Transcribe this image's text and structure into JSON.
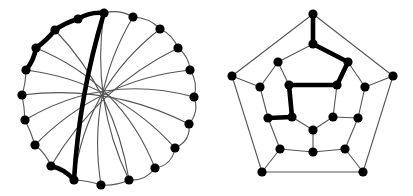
{
  "figure": {
    "background_color": "#ffffff",
    "width": 413,
    "height": 196,
    "vertex_color": "#000000",
    "edge_color": "#555555",
    "highlight_color": "#000000",
    "vertex_radius": 4.6,
    "edge_width": 1.1,
    "highlight_width": 4.6
  },
  "chart_data": {
    "type": "diagram",
    "panels": [
      {
        "name": "circular-layout",
        "label": "Circular Hamiltonian drawing",
        "vertex_count": 20,
        "edge_count": 30,
        "highlighted_cycle_length": 6
      },
      {
        "name": "pentagonal-layout",
        "label": "Pentagonal GP(10,3) drawing",
        "vertex_count": 20,
        "edge_count": 30,
        "highlighted_cycle_length": 6
      }
    ]
  },
  "left_graph": {
    "name": "circular-layout",
    "center": [
      110,
      98
    ],
    "radius_x": 85,
    "radius_y": 88,
    "vertices": [
      {
        "id": "L0",
        "x": 104,
        "y": 13
      },
      {
        "id": "L1",
        "x": 133,
        "y": 17
      },
      {
        "id": "L2",
        "x": 160,
        "y": 29
      },
      {
        "id": "L3",
        "x": 178,
        "y": 48
      },
      {
        "id": "L4",
        "x": 190,
        "y": 70
      },
      {
        "id": "L5",
        "x": 194,
        "y": 97
      },
      {
        "id": "L6",
        "x": 189,
        "y": 124
      },
      {
        "id": "L7",
        "x": 175,
        "y": 148
      },
      {
        "id": "L8",
        "x": 155,
        "y": 168
      },
      {
        "id": "L9",
        "x": 129,
        "y": 180
      },
      {
        "id": "L10",
        "x": 101,
        "y": 185
      },
      {
        "id": "L11",
        "x": 74,
        "y": 180
      },
      {
        "id": "L12",
        "x": 51,
        "y": 166
      },
      {
        "id": "L13",
        "x": 35,
        "y": 145
      },
      {
        "id": "L14",
        "x": 25,
        "y": 120
      },
      {
        "id": "L15",
        "x": 22,
        "y": 95
      },
      {
        "id": "L16",
        "x": 26,
        "y": 70
      },
      {
        "id": "L17",
        "x": 36,
        "y": 48
      },
      {
        "id": "L18",
        "x": 55,
        "y": 30
      },
      {
        "id": "L19",
        "x": 78,
        "y": 19
      }
    ],
    "rim_edges": [
      [
        "L0",
        "L1"
      ],
      [
        "L1",
        "L2"
      ],
      [
        "L2",
        "L3"
      ],
      [
        "L3",
        "L4"
      ],
      [
        "L4",
        "L5"
      ],
      [
        "L5",
        "L6"
      ],
      [
        "L6",
        "L7"
      ],
      [
        "L7",
        "L8"
      ],
      [
        "L8",
        "L9"
      ],
      [
        "L9",
        "L10"
      ],
      [
        "L10",
        "L11"
      ],
      [
        "L11",
        "L12"
      ],
      [
        "L12",
        "L13"
      ],
      [
        "L13",
        "L14"
      ],
      [
        "L14",
        "L15"
      ],
      [
        "L15",
        "L16"
      ],
      [
        "L16",
        "L17"
      ],
      [
        "L17",
        "L18"
      ],
      [
        "L18",
        "L19"
      ],
      [
        "L19",
        "L0"
      ]
    ],
    "chord_edges": [
      [
        "L0",
        "L9"
      ],
      [
        "L1",
        "L10"
      ],
      [
        "L2",
        "L11"
      ],
      [
        "L3",
        "L12"
      ],
      [
        "L4",
        "L13"
      ],
      [
        "L5",
        "L14"
      ],
      [
        "L6",
        "L15"
      ],
      [
        "L7",
        "L16"
      ],
      [
        "L8",
        "L17"
      ],
      [
        "L9",
        "L18"
      ]
    ],
    "bold_edges": [
      [
        "L0",
        "L19"
      ],
      [
        "L19",
        "L18"
      ],
      [
        "L18",
        "L17"
      ],
      [
        "L17",
        "L16"
      ],
      [
        "L0",
        "L11"
      ],
      [
        "L11",
        "L12"
      ]
    ]
  },
  "right_graph": {
    "name": "pentagonal-layout",
    "center": [
      313,
      105
    ],
    "vertices": [
      {
        "id": "R0",
        "x": 313,
        "y": 14
      },
      {
        "id": "R1",
        "x": 393,
        "y": 76
      },
      {
        "id": "R2",
        "x": 363,
        "y": 172
      },
      {
        "id": "R3",
        "x": 262,
        "y": 172
      },
      {
        "id": "R4",
        "x": 232,
        "y": 76
      },
      {
        "id": "R5",
        "x": 313,
        "y": 44
      },
      {
        "id": "R6",
        "x": 365,
        "y": 87
      },
      {
        "id": "R7",
        "x": 345,
        "y": 149
      },
      {
        "id": "R8",
        "x": 280,
        "y": 149
      },
      {
        "id": "R9",
        "x": 260,
        "y": 87
      },
      {
        "id": "R10",
        "x": 348,
        "y": 62
      },
      {
        "id": "R11",
        "x": 358,
        "y": 118
      },
      {
        "id": "R12",
        "x": 313,
        "y": 152
      },
      {
        "id": "R13",
        "x": 268,
        "y": 118
      },
      {
        "id": "R14",
        "x": 278,
        "y": 62
      },
      {
        "id": "R15",
        "x": 337,
        "y": 85
      },
      {
        "id": "R16",
        "x": 333,
        "y": 117
      },
      {
        "id": "R17",
        "x": 313,
        "y": 130
      },
      {
        "id": "R18",
        "x": 292,
        "y": 117
      },
      {
        "id": "R19",
        "x": 289,
        "y": 85
      }
    ],
    "outer_edges": [
      [
        "R0",
        "R1"
      ],
      [
        "R1",
        "R2"
      ],
      [
        "R2",
        "R3"
      ],
      [
        "R3",
        "R4"
      ],
      [
        "R4",
        "R0"
      ]
    ],
    "spoke_edges": [
      [
        "R0",
        "R5"
      ],
      [
        "R1",
        "R6"
      ],
      [
        "R2",
        "R7"
      ],
      [
        "R3",
        "R8"
      ],
      [
        "R4",
        "R9"
      ]
    ],
    "mid_edges": [
      [
        "R5",
        "R10"
      ],
      [
        "R10",
        "R6"
      ],
      [
        "R6",
        "R11"
      ],
      [
        "R11",
        "R7"
      ],
      [
        "R7",
        "R12"
      ],
      [
        "R12",
        "R8"
      ],
      [
        "R8",
        "R13"
      ],
      [
        "R13",
        "R9"
      ],
      [
        "R9",
        "R14"
      ],
      [
        "R14",
        "R5"
      ]
    ],
    "inner_spoke_edges": [
      [
        "R10",
        "R15"
      ],
      [
        "R11",
        "R16"
      ],
      [
        "R12",
        "R17"
      ],
      [
        "R13",
        "R18"
      ],
      [
        "R14",
        "R19"
      ]
    ],
    "inner_edges": [
      [
        "R15",
        "R16"
      ],
      [
        "R16",
        "R17"
      ],
      [
        "R17",
        "R18"
      ],
      [
        "R18",
        "R19"
      ],
      [
        "R19",
        "R15"
      ]
    ],
    "bold_edges": [
      [
        "R0",
        "R5"
      ],
      [
        "R5",
        "R10"
      ],
      [
        "R10",
        "R15"
      ],
      [
        "R15",
        "R19"
      ],
      [
        "R19",
        "R18"
      ],
      [
        "R18",
        "R13"
      ]
    ]
  }
}
